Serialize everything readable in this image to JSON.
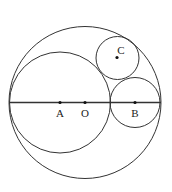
{
  "diagram": {
    "type": "geometry",
    "stroke_color": "#333333",
    "circles": [
      {
        "name": "outer-circle",
        "cx": 85,
        "cy": 102.5,
        "r": 76
      },
      {
        "name": "circle-a",
        "cx": 60,
        "cy": 102.5,
        "r": 50.5
      },
      {
        "name": "circle-b",
        "cx": 135,
        "cy": 102.5,
        "r": 25
      },
      {
        "name": "circle-c",
        "cx": 117.5,
        "cy": 58,
        "r": 21.5
      }
    ],
    "diameter_line": {
      "x1": 9,
      "y1": 102.5,
      "x2": 161,
      "y2": 102.5
    },
    "points": [
      {
        "label": "A",
        "x": 60,
        "y": 102.5,
        "label_x": 60,
        "label_y": 117
      },
      {
        "label": "O",
        "x": 85,
        "y": 102.5,
        "label_x": 85,
        "label_y": 117
      },
      {
        "label": "B",
        "x": 135,
        "y": 102.5,
        "label_x": 135,
        "label_y": 117
      },
      {
        "label": "C",
        "x": 117,
        "y": 57.5,
        "label_x": 121,
        "label_y": 54
      }
    ]
  }
}
